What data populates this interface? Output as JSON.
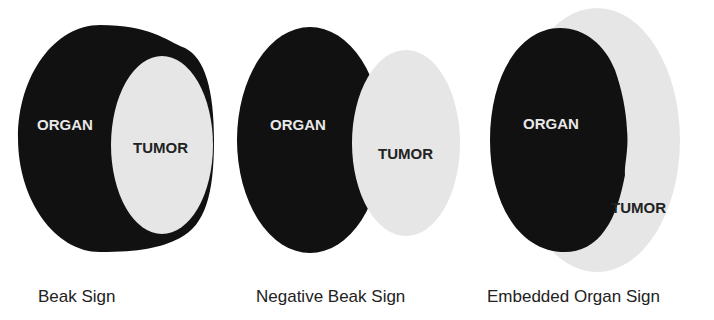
{
  "colors": {
    "organ": "#111111",
    "tumor": "#e6e6e6",
    "organ_label": "#e8e8e8",
    "tumor_label": "#222222"
  },
  "panels": [
    {
      "caption": "Beak Sign",
      "organ_label": "ORGAN",
      "tumor_label": "TUMOR"
    },
    {
      "caption": "Negative Beak Sign",
      "organ_label": "ORGAN",
      "tumor_label": "TUMOR"
    },
    {
      "caption": "Embedded Organ Sign",
      "organ_label": "ORGAN",
      "tumor_label": "TUMOR"
    }
  ]
}
